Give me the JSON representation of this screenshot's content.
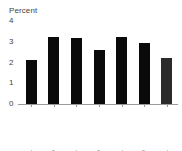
{
  "chart_data": {
    "type": "bar",
    "title": "",
    "ylabel": "Percent",
    "xlabel": "",
    "categories": [
      "1990-94",
      "1995-99",
      "2000-04",
      "2005-09",
      "2010-14",
      "2015-19",
      "2020-24"
    ],
    "values": [
      2.1,
      3.25,
      3.2,
      2.6,
      3.25,
      2.95,
      2.2
    ],
    "ylim": [
      0,
      4
    ],
    "yticks": [
      "0",
      "1",
      "2",
      "3",
      "4"
    ],
    "ytick_values": [
      0,
      1,
      2,
      3,
      4
    ],
    "grid": false,
    "legend": "none",
    "bar_color": "#0a0a0a",
    "projected_bar_color": "#2b2b2b",
    "projected_indices": [
      6
    ],
    "axis_color": "#9a9a9a",
    "text_color": "#3f3f3f",
    "background": "#ffffff"
  }
}
